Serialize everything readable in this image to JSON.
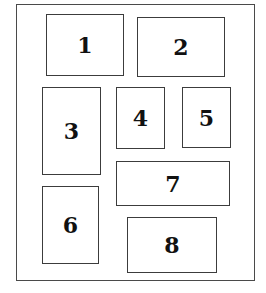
{
  "diagram": {
    "type": "numbered-layout-boxes",
    "frame_color": "#4a4a4a",
    "box_border_color": "#3c3c3c",
    "background": "#ffffff",
    "boxes": [
      {
        "label": "1"
      },
      {
        "label": "2"
      },
      {
        "label": "3"
      },
      {
        "label": "4"
      },
      {
        "label": "5"
      },
      {
        "label": "6"
      },
      {
        "label": "7"
      },
      {
        "label": "8"
      }
    ]
  }
}
